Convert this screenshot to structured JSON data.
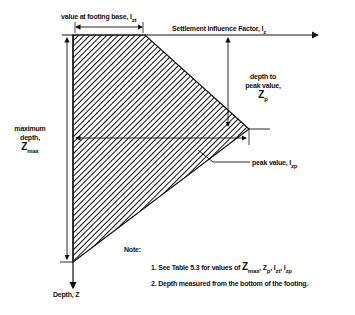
{
  "diagram": {
    "axis_x_label": "Settlement Influence Factor, I",
    "axis_x_sub": "z",
    "axis_y_label": "Depth, Z",
    "footing_value_label": "value at footing base, I",
    "footing_value_sub": "zt",
    "depth_to_peak_line1": "depth to",
    "depth_to_peak_line2": "peak value,",
    "depth_to_peak_symbol": "Z",
    "depth_to_peak_sub": "p",
    "max_depth_line1": "maximum",
    "max_depth_line2": "depth,",
    "max_depth_symbol": "Z",
    "max_depth_sub": "max",
    "peak_value_label": "peak value, I",
    "peak_value_sub": "zp"
  },
  "notes": {
    "heading": "Note:",
    "note1_prefix": "1. See Table 5.3 for values of ",
    "note1_z": "Z",
    "note1_zmax_sub": "max",
    "note1_sep1": ", Z",
    "note1_zp_sub": "p",
    "note1_sep2": ", I",
    "note1_izt_sub": "zt",
    "note1_sep3": ", I",
    "note1_izp_sub": "zp",
    "note2": "2. Depth measured from the bottom of the footing."
  },
  "colors": {
    "ink": "#111111",
    "background": "#ffffff"
  }
}
